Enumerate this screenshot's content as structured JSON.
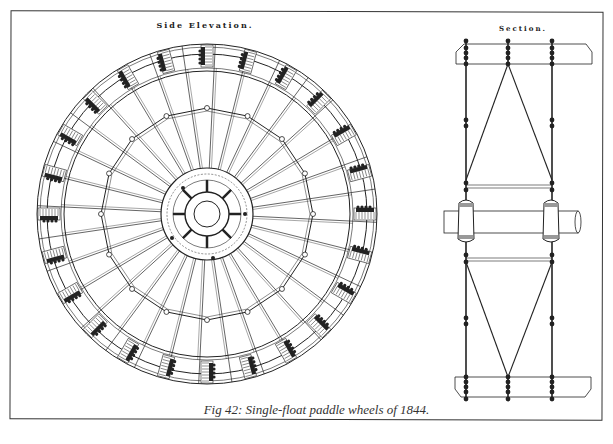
{
  "figure": {
    "caption": "Fig 42: Single-float paddle wheels of 1844.",
    "views": [
      {
        "id": "side-elevation",
        "title": "Side Elevation."
      },
      {
        "id": "section",
        "title": "Section."
      }
    ]
  },
  "side_elevation": {
    "center": [
      207,
      214
    ],
    "rim_radii": [
      170,
      160,
      146
    ],
    "inner_ring_radius": 106,
    "hub_radii": [
      46,
      40,
      22,
      13
    ],
    "arm_count": 32,
    "float_count": 24,
    "hub_spoke_count": 8
  },
  "section": {
    "x_left": 452,
    "x_right": 595,
    "columns_x": [
      466,
      508,
      552
    ],
    "top_float_box": [
      456,
      44,
      136,
      20
    ],
    "bottom_float_box": [
      455,
      377,
      136,
      20
    ],
    "shaft": {
      "y": 211,
      "height": 22,
      "x1": 444,
      "x2": 578
    },
    "hub_blocks_x": [
      466,
      551
    ]
  },
  "colors": {
    "ink": "#222222",
    "paper": "#ffffff",
    "frame": "#333333"
  }
}
